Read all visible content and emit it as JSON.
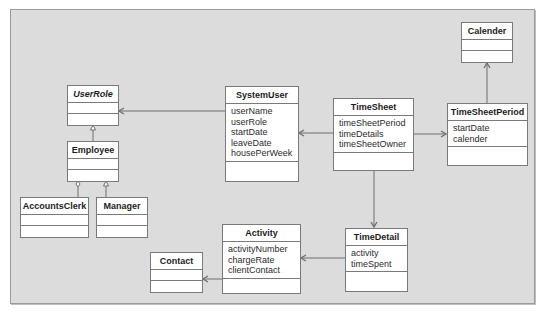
{
  "diagram": {
    "type": "UML class diagram",
    "classes": {
      "calender": {
        "name": "Calender",
        "attributes": []
      },
      "userrole": {
        "name": "UserRole",
        "abstract": true,
        "attributes": []
      },
      "employee": {
        "name": "Employee",
        "attributes": []
      },
      "accountsclerk": {
        "name": "AccountsClerk",
        "attributes": []
      },
      "manager": {
        "name": "Manager",
        "attributes": []
      },
      "systemuser": {
        "name": "SystemUser",
        "attributes": [
          "userName",
          "userRole",
          "startDate",
          "leaveDate",
          "housePerWeek"
        ]
      },
      "timesheet": {
        "name": "TimeSheet",
        "attributes": [
          "timeSheetPeriod",
          "timeDetails",
          "timeSheetOwner"
        ]
      },
      "timesheetperiod": {
        "name": "TimeSheetPeriod",
        "attributes": [
          "startDate",
          "calender"
        ]
      },
      "timedetail": {
        "name": "TimeDetail",
        "attributes": [
          "activity",
          "timeSpent"
        ]
      },
      "activity": {
        "name": "Activity",
        "attributes": [
          "activityNumber",
          "chargeRate",
          "clientContact"
        ]
      },
      "contact": {
        "name": "Contact",
        "attributes": []
      }
    },
    "relationships": [
      {
        "from": "SystemUser",
        "to": "UserRole",
        "kind": "association-navigable"
      },
      {
        "from": "TimeSheet",
        "to": "SystemUser",
        "kind": "association-navigable"
      },
      {
        "from": "TimeSheet",
        "to": "TimeSheetPeriod",
        "kind": "association-navigable"
      },
      {
        "from": "TimeSheetPeriod",
        "to": "Calender",
        "kind": "association-navigable"
      },
      {
        "from": "Employee",
        "to": "UserRole",
        "kind": "generalization"
      },
      {
        "from": "AccountsClerk",
        "to": "Employee",
        "kind": "aggregation"
      },
      {
        "from": "Manager",
        "to": "Employee",
        "kind": "generalization"
      },
      {
        "from": "TimeSheet",
        "to": "TimeDetail",
        "kind": "association-navigable"
      },
      {
        "from": "TimeDetail",
        "to": "Activity",
        "kind": "association-navigable"
      },
      {
        "from": "Activity",
        "to": "Contact",
        "kind": "association-navigable"
      }
    ],
    "colors": {
      "background": "#dcdcdc",
      "box": "#ffffff",
      "line": "#7a7a7a",
      "text": "#1c1c1c"
    }
  }
}
